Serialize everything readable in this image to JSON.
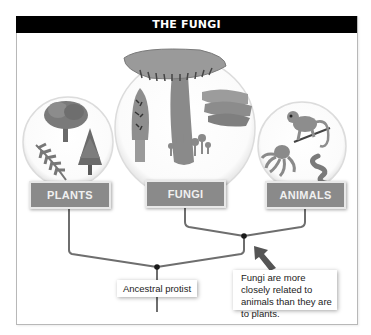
{
  "title": "THE FUNGI",
  "groups": [
    {
      "label": "PLANTS",
      "illustration": "tree-fern-conifer"
    },
    {
      "label": "FUNGI",
      "illustration": "mushroom-morel-bracket-fungi"
    },
    {
      "label": "ANIMALS",
      "illustration": "monkey-octopus-worm"
    }
  ],
  "tree": {
    "root_label": "Ancestral protist",
    "callout": "Fungi are more closely related to animals than they are to plants."
  },
  "colors": {
    "title_bg": "#000000",
    "label_fill": "#8a8a8a",
    "branch_line": "#6e6e6e",
    "node": "#1a1a1a",
    "arrow": "#555555"
  }
}
